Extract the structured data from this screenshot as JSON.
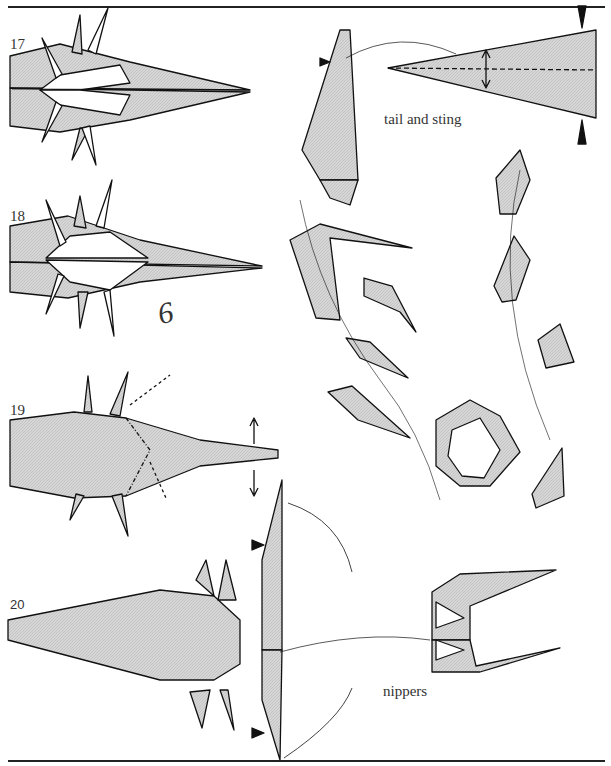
{
  "page": {
    "type": "origami diagram page"
  },
  "steps": [
    {
      "number": "17"
    },
    {
      "number": "18",
      "annotation": "6"
    },
    {
      "number": "19"
    },
    {
      "number": "20"
    }
  ],
  "labels": {
    "tail": "tail and sting",
    "nippers": "nippers"
  },
  "colors": {
    "paper": "#cfcfcf",
    "line": "#111111",
    "background": "#ffffff"
  }
}
